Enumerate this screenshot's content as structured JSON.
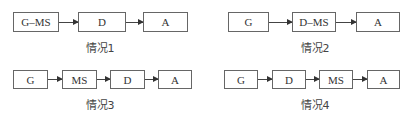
{
  "diagrams": [
    {
      "caption": "情况1",
      "nodes": [
        "G–MS",
        "D",
        "A"
      ]
    },
    {
      "caption": "情况2",
      "nodes": [
        "G",
        "D–MS",
        "A"
      ]
    },
    {
      "caption": "情况3",
      "nodes": [
        "G",
        "MS",
        "D",
        "A"
      ]
    },
    {
      "caption": "情况4",
      "nodes": [
        "G",
        "D",
        "MS",
        "A"
      ]
    }
  ]
}
